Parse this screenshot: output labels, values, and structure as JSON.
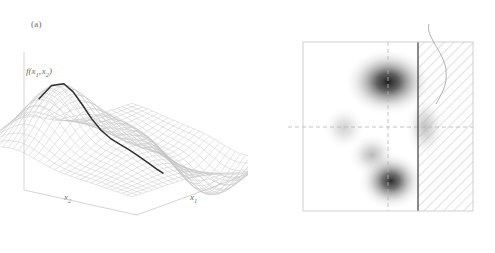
{
  "figure": {
    "background": "#ffffff",
    "panels": [
      {
        "id": "a",
        "label": "(a)",
        "type": "surface-3d",
        "vertical_axis_label": "f(x",
        "vertical_axis_label_full": "f(x1, x2)",
        "axis_x_left_label": "x",
        "axis_x_right_label": "x"
      },
      {
        "id": "b",
        "label": "(b)",
        "type": "contour-2d",
        "axis_y_label": "x",
        "axis_x_label": "x",
        "constraint_label": "x",
        "constraint_relation": "≥",
        "constraint_value": "1"
      }
    ]
  },
  "labels": {
    "panel_a": "(a)",
    "panel_b": "(b)",
    "f_name": "f",
    "paren_open": "(",
    "paren_close": ")",
    "comma": ",",
    "x": "x",
    "sub1": "1",
    "sub2": "2",
    "ge": "≥",
    "one": "1"
  },
  "colors": {
    "mesh": "#b9b9b9",
    "mesh_light": "#d9d9d9",
    "curve": "#2f2f2f",
    "axis": "#cfcfcf",
    "box": "#c9c9c9",
    "hatch": "#b0b0b0",
    "constraint_line": "#4a4a4a",
    "dashed_guide": "#b5b5b5",
    "text": "#6a6a6a",
    "blob_dark": "#1f1f1f",
    "blob_mid": "#9a9a9a"
  },
  "chart_data": [
    {
      "type": "line",
      "subtype": "3d-surface-with-trace",
      "panel": "a",
      "title": "(a)",
      "zlabel": "f(x1, x2)",
      "xlabel": "x1",
      "ylabel": "x2",
      "grid": true,
      "description": "Wireframe mesh of a two-dimensional function with one tall positive peak at upper-left, a smaller secondary peak near the centre, a negative trough at lower-left and a deep negative well at lower-right; a dark solid curve traces a slice across the surface.",
      "surface_features": [
        {
          "name": "major-peak",
          "x": -0.65,
          "y": 0.55,
          "height": 1.0
        },
        {
          "name": "minor-peak",
          "x": 0.0,
          "y": -0.1,
          "height": 0.38
        },
        {
          "name": "shallow-ridge",
          "x": 0.45,
          "y": 0.45,
          "height": 0.22
        },
        {
          "name": "trough-left",
          "x": -0.35,
          "y": -0.6,
          "height": -0.35
        },
        {
          "name": "deep-well",
          "x": 0.55,
          "y": -0.7,
          "height": -0.78
        }
      ],
      "trace_curve": {
        "name": "f slice",
        "x": [
          -1.0,
          -0.8,
          -0.6,
          -0.45,
          -0.3,
          -0.15,
          0.0,
          0.15,
          0.3,
          0.45,
          0.6,
          0.75,
          0.9,
          1.0
        ],
        "y": [
          0.62,
          0.78,
          0.92,
          0.88,
          0.8,
          0.72,
          0.55,
          0.33,
          0.1,
          -0.12,
          -0.3,
          -0.34,
          -0.22,
          -0.2
        ]
      }
    },
    {
      "type": "heatmap",
      "subtype": "contour-density",
      "panel": "b",
      "title": "(b)",
      "xlabel": "x1",
      "ylabel": "x2",
      "grid": false,
      "xlim": [
        -2,
        2
      ],
      "ylim": [
        -2,
        2
      ],
      "guides": {
        "vertical_dashed_x": 0,
        "horizontal_dashed_y": 0
      },
      "constraint": {
        "label": "x1 ≥ 1",
        "boundary_x": 1,
        "shaded_side": "right",
        "style": "diagonal-hatch"
      },
      "blobs": [
        {
          "name": "top-dark",
          "cx": 0.26,
          "cy": 0.92,
          "rx": 0.52,
          "ry": 0.4,
          "intensity": 1.0
        },
        {
          "name": "left-faint",
          "cx": -0.78,
          "cy": 0.15,
          "rx": 0.26,
          "ry": 0.26,
          "intensity": 0.32
        },
        {
          "name": "mid-faint",
          "cx": -0.22,
          "cy": -0.32,
          "rx": 0.28,
          "ry": 0.26,
          "intensity": 0.42
        },
        {
          "name": "bottom-dark",
          "cx": 0.3,
          "cy": -1.02,
          "rx": 0.38,
          "ry": 0.34,
          "intensity": 0.92
        },
        {
          "name": "right-clipped",
          "cx": 1.12,
          "cy": 0.02,
          "rx": 0.24,
          "ry": 0.36,
          "intensity": 0.38
        }
      ]
    }
  ]
}
